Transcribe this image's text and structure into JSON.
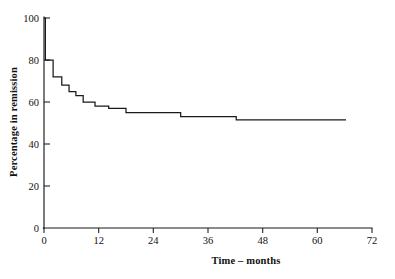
{
  "chart_data": {
    "type": "line",
    "subtype": "step-post",
    "title": "",
    "xlabel": "Time – months",
    "ylabel": "Percentage in remission",
    "xlim": [
      0,
      72
    ],
    "ylim": [
      0,
      100
    ],
    "xticks": [
      0,
      12,
      24,
      36,
      48,
      60,
      72
    ],
    "xtick_labels": [
      "0",
      "12",
      "24",
      "36",
      "48",
      "60",
      "72"
    ],
    "yticks": [
      0,
      20,
      40,
      60,
      80,
      100
    ],
    "ytick_labels": [
      "0",
      "20",
      "40",
      "60",
      "80",
      "100"
    ],
    "grid": false,
    "legend": null,
    "series": [
      {
        "name": "Percentage in remission",
        "color": "#1a1a1a",
        "x": [
          0,
          0.3,
          2.0,
          3.9,
          5.5,
          7.0,
          8.6,
          11.2,
          14.2,
          18.0,
          30.0,
          42.2,
          66.3
        ],
        "y": [
          100,
          80,
          72,
          68,
          65,
          63,
          60,
          58,
          57,
          55,
          53,
          51.5,
          51.5
        ]
      }
    ],
    "annotations": []
  },
  "axes": {
    "y_axis_title": "Percentage in remission",
    "x_axis_title": "Time – months"
  }
}
